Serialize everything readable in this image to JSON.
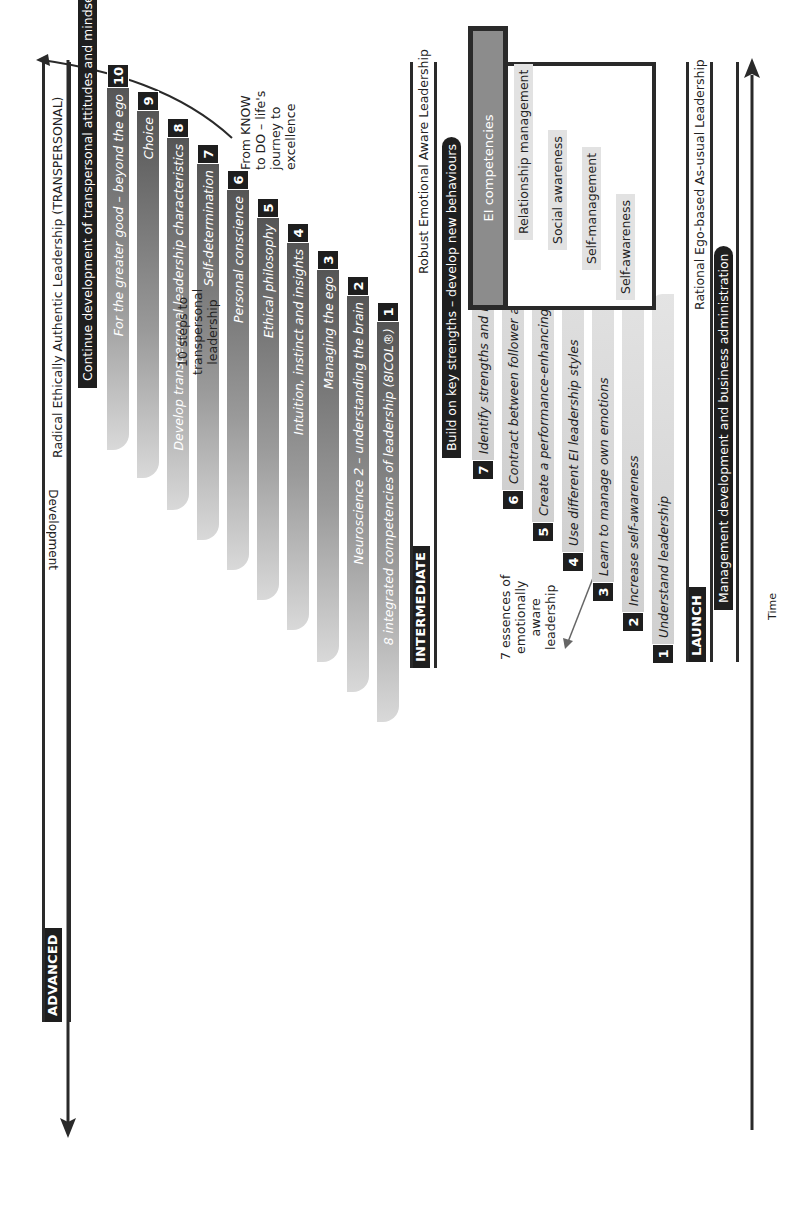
{
  "axes": {
    "development_label": "Development",
    "time_label": "Time"
  },
  "levels": {
    "advanced": {
      "tag": "ADVANCED",
      "band_title": "Radical Ethically Authentic Leadership (TRANSPERSONAL)",
      "header_bar": "Continue development of transpersonal attitudes and mindsets",
      "note": [
        "10 steps to",
        "transpersonal",
        "leadership"
      ],
      "callout": [
        "From KNOW",
        "to DO – life's",
        "journey to",
        "excellence"
      ],
      "steps": [
        {
          "num": "1",
          "label": "8 integrated competencies of leadership (8ICOL®)"
        },
        {
          "num": "2",
          "label": "Neuroscience 2 – understanding the brain"
        },
        {
          "num": "3",
          "label": "Managing the ego"
        },
        {
          "num": "4",
          "label": "Intuition, instinct and insights"
        },
        {
          "num": "5",
          "label": "Ethical philosophy"
        },
        {
          "num": "6",
          "label": "Personal conscience"
        },
        {
          "num": "7",
          "label": "Self-determination"
        },
        {
          "num": "8",
          "label": "Develop transpersonal leadership characteristics"
        },
        {
          "num": "9",
          "label": "Choice"
        },
        {
          "num": "10",
          "label": "For the greater good – beyond the ego"
        }
      ]
    },
    "intermediate": {
      "tag": "INTERMEDIATE",
      "band_title": "Robust Emotional Aware Leadership",
      "header_bar": "Build on key strengths – develop new behaviours",
      "note": [
        "7 essences of",
        "emotionally",
        "aware",
        "leadership"
      ],
      "steps": [
        {
          "num": "1",
          "label": "Understand leadership"
        },
        {
          "num": "2",
          "label": "Increase self-awareness"
        },
        {
          "num": "3",
          "label": "Learn to manage own emotions"
        },
        {
          "num": "4",
          "label": "Use different EI leadership styles"
        },
        {
          "num": "5",
          "label": "Create a performance-enhancing culture"
        },
        {
          "num": "6",
          "label": "Contract between follower and leader"
        },
        {
          "num": "7",
          "label": "Identify strengths and key development needs (LEIPA®)"
        }
      ],
      "ei_box": {
        "title": "EI competencies",
        "items": [
          "Relationship management",
          "Social awareness",
          "Self-management",
          "Self-awareness"
        ]
      }
    },
    "launch": {
      "tag": "LAUNCH",
      "band_title": "Rational Ego-based As-usual Leadership",
      "header_bar": "Management development and business administration"
    }
  }
}
